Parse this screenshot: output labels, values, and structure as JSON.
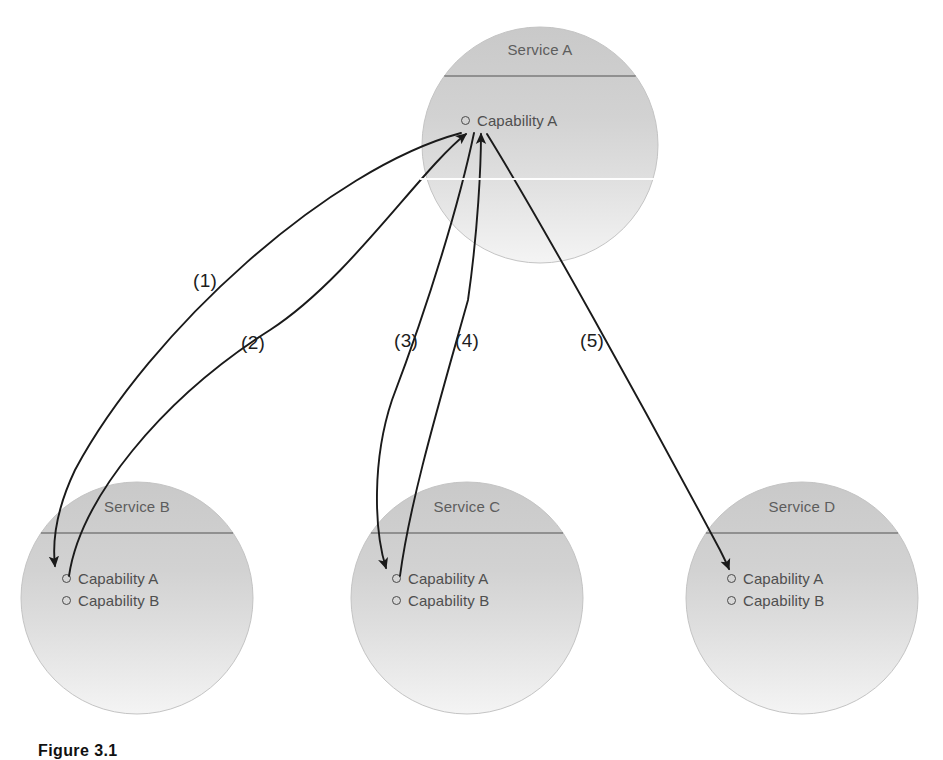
{
  "figure": {
    "caption": "Figure 3.1",
    "background_color": "#ffffff",
    "circle_fill_top": "#cfcfcf",
    "circle_fill_bottom": "#f2f2f2",
    "divider_color": "#7b7b7b",
    "arrow_color": "#1a1a1a",
    "text_color": "#4f4f4f"
  },
  "services": [
    {
      "id": "service-a",
      "title": "Service A",
      "cx": 540,
      "cy": 145,
      "r": 118,
      "title_top": 41,
      "divider_y": 76,
      "capabilities": [
        {
          "label": "Capability A",
          "x": 461,
          "y": 112
        }
      ]
    },
    {
      "id": "service-b",
      "title": "Service B",
      "cx": 137,
      "cy": 598,
      "r": 116,
      "title_top": 498,
      "divider_y": 533,
      "capabilities": [
        {
          "label": "Capability A",
          "x": 62,
          "y": 570
        },
        {
          "label": "Capability B",
          "x": 62,
          "y": 592
        }
      ]
    },
    {
      "id": "service-c",
      "title": "Service C",
      "cx": 467,
      "cy": 598,
      "r": 116,
      "title_top": 498,
      "divider_y": 533,
      "capabilities": [
        {
          "label": "Capability A",
          "x": 392,
          "y": 570
        },
        {
          "label": "Capability B",
          "x": 392,
          "y": 592
        }
      ]
    },
    {
      "id": "service-d",
      "title": "Service D",
      "cx": 802,
      "cy": 598,
      "r": 116,
      "title_top": 498,
      "divider_y": 533,
      "capabilities": [
        {
          "label": "Capability A",
          "x": 727,
          "y": 570
        },
        {
          "label": "Capability B",
          "x": 727,
          "y": 592
        }
      ]
    }
  ],
  "edges": [
    {
      "id": "edge-1",
      "label": "(1)",
      "from": "service-a",
      "to": "service-b",
      "label_x": 193,
      "label_y": 270,
      "path": "M 461 133 C 330 168 150 330 75 470 C 57 508 52 540 55 566",
      "arrowhead": "end"
    },
    {
      "id": "edge-2",
      "label": "(2)",
      "from": "service-b",
      "to": "service-a",
      "label_x": 241,
      "label_y": 332,
      "path": "M 69 576 C 80 500 160 400 270 330 C 350 278 420 170 466 134",
      "arrowhead": "end"
    },
    {
      "id": "edge-3",
      "label": "(3)",
      "from": "service-a",
      "to": "service-c",
      "label_x": 394,
      "label_y": 330,
      "path": "M 474 133 C 460 200 430 300 392 400 C 372 460 374 530 386 568",
      "arrowhead": "end"
    },
    {
      "id": "edge-4",
      "label": "(4)",
      "from": "service-c",
      "to": "service-a",
      "label_x": 455,
      "label_y": 330,
      "path": "M 400 576 C 410 500 440 400 468 300 C 478 230 481 165 481 134",
      "arrowhead": "end"
    },
    {
      "id": "edge-5",
      "label": "(5)",
      "from": "service-a",
      "to": "service-d",
      "label_x": 580,
      "label_y": 330,
      "path": "M 487 134 C 540 220 640 400 720 550 C 724 558 727 564 729 569",
      "arrowhead": "end"
    }
  ]
}
